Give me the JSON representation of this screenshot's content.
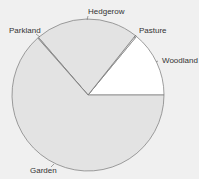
{
  "chart_data": {
    "type": "pie",
    "title": "",
    "categories": [
      "Woodland",
      "Pasture",
      "Hedgerow",
      "Parkland",
      "Garden"
    ],
    "values": [
      14,
      0.3,
      22,
      0.2,
      63.5
    ],
    "colors": [
      "#ffffff",
      "#ffffff",
      "#e3e3e3",
      "#e3e3e3",
      "#e3e3e3"
    ],
    "start_angle_deg": 0,
    "direction": "counterclockwise",
    "legend": "none (labels on slices)"
  },
  "labels": {
    "woodland": "Woodland",
    "pasture": "Pasture",
    "hedgerow": "Hedgerow",
    "parkland": "Parkland",
    "garden": "Garden"
  }
}
